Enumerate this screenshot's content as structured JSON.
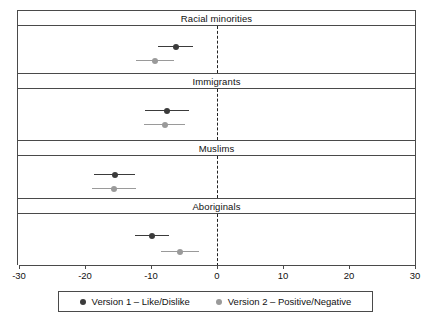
{
  "chart_data": {
    "type": "scatter",
    "title": "",
    "subtitle": "",
    "xlabel": "",
    "ylabel": "",
    "xlim": [
      -30,
      30
    ],
    "xticks": [
      -30,
      -20,
      -10,
      0,
      10,
      20,
      30
    ],
    "xtick_labels": [
      "-30",
      "-20",
      "-10",
      "0",
      "10",
      "20",
      "30"
    ],
    "grid": false,
    "reference_line": 0,
    "reference_line_style": "dashed",
    "legend_position": "bottom",
    "orientation": "horizontal",
    "panel_labels": [
      "Racial minorities",
      "Immigrants",
      "Muslims",
      "Aboriginals"
    ],
    "series": [
      {
        "name": "Version 1 – Like/Dislike",
        "color": "#3b3b3b",
        "values": [
          -6.2,
          -7.6,
          -15.5,
          -9.8
        ],
        "ci_low": [
          -8.9,
          -10.9,
          -18.6,
          -12.4
        ],
        "ci_high": [
          -3.6,
          -4.2,
          -12.4,
          -7.2
        ]
      },
      {
        "name": "Version 2 – Positive/Negative",
        "color": "#9a9a9a",
        "values": [
          -9.4,
          -7.9,
          -15.6,
          -5.6
        ],
        "ci_low": [
          -12.3,
          -11.0,
          -19.0,
          -8.5
        ],
        "ci_high": [
          -6.5,
          -4.8,
          -12.2,
          -2.8
        ]
      }
    ],
    "panels": [
      {
        "label": "Racial minorities",
        "rows": [
          {
            "series": "Version 1 – Like/Dislike",
            "estimate": -6.2,
            "ci_low": -8.9,
            "ci_high": -3.6
          },
          {
            "series": "Version 2 – Positive/Negative",
            "estimate": -9.4,
            "ci_low": -12.3,
            "ci_high": -6.5
          }
        ]
      },
      {
        "label": "Immigrants",
        "rows": [
          {
            "series": "Version 1 – Like/Dislike",
            "estimate": -7.6,
            "ci_low": -10.9,
            "ci_high": -4.2
          },
          {
            "series": "Version 2 – Positive/Negative",
            "estimate": -7.9,
            "ci_low": -11.0,
            "ci_high": -4.8
          }
        ]
      },
      {
        "label": "Muslims",
        "rows": [
          {
            "series": "Version 1 – Like/Dislike",
            "estimate": -15.5,
            "ci_low": -18.6,
            "ci_high": -12.4
          },
          {
            "series": "Version 2 – Positive/Negative",
            "estimate": -15.6,
            "ci_low": -19.0,
            "ci_high": -12.2
          }
        ]
      },
      {
        "label": "Aboriginals",
        "rows": [
          {
            "series": "Version 1 – Like/Dislike",
            "estimate": -9.8,
            "ci_low": -12.4,
            "ci_high": -7.2
          },
          {
            "series": "Version 2 – Positive/Negative",
            "estimate": -5.6,
            "ci_low": -8.5,
            "ci_high": -2.8
          }
        ]
      }
    ]
  },
  "legend": {
    "entries": [
      {
        "label": "Version 1 – Like/Dislike",
        "color": "#3b3b3b"
      },
      {
        "label": "Version 2 – Positive/Negative",
        "color": "#9a9a9a"
      }
    ]
  },
  "colors": {
    "version1": "#3b3b3b",
    "version2": "#9a9a9a",
    "frame": "#4a4a4a",
    "reference": "#222222",
    "background": "#ffffff"
  }
}
